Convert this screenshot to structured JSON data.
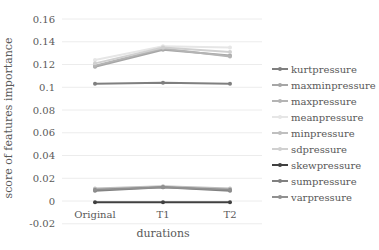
{
  "chart_data": {
    "type": "line",
    "title": "",
    "xlabel": "durations",
    "ylabel": "score of features importance",
    "categories": [
      "Original",
      "T1",
      "T2"
    ],
    "ylim": [
      -0.02,
      0.16
    ],
    "yticks": [
      "0.16",
      "0.14",
      "0.12",
      "0.1",
      "0.08",
      "0.06",
      "0.04",
      "0.02",
      "0",
      "-0.02"
    ],
    "grid": true,
    "legend_position": "right",
    "series": [
      {
        "name": "kurtpressure",
        "color": "#7f7f7f",
        "values": [
          0.103,
          0.104,
          0.103
        ]
      },
      {
        "name": "maxminpressure",
        "color": "#a6a6a6",
        "values": [
          0.118,
          0.133,
          0.128
        ]
      },
      {
        "name": "maxpressure",
        "color": "#b4b4b4",
        "values": [
          0.119,
          0.134,
          0.127
        ]
      },
      {
        "name": "meanpressure",
        "color": "#e6e6e6",
        "values": [
          0.124,
          0.136,
          0.135
        ]
      },
      {
        "name": "minpressure",
        "color": "#bfbfbf",
        "values": [
          0.011,
          0.013,
          0.011
        ]
      },
      {
        "name": "sdpressure",
        "color": "#d0d0d0",
        "values": [
          0.121,
          0.135,
          0.131
        ]
      },
      {
        "name": "skewpressure",
        "color": "#404040",
        "values": [
          -0.001,
          -0.001,
          -0.001
        ]
      },
      {
        "name": "sumpressure",
        "color": "#808080",
        "values": [
          0.009,
          0.012,
          0.009
        ]
      },
      {
        "name": "varpressure",
        "color": "#909090",
        "values": [
          0.01,
          0.012,
          0.01
        ]
      }
    ]
  }
}
